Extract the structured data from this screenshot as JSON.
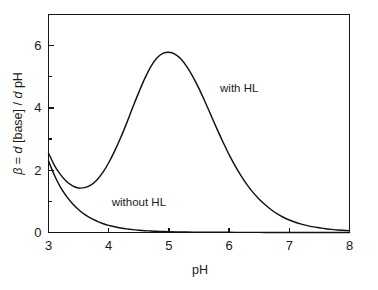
{
  "chart_data": {
    "type": "line",
    "title": "",
    "xlabel": "pH",
    "ylabel_parts": {
      "beta": "β",
      "equals": " = ",
      "d1": "d",
      "base": " [base] / ",
      "d2": "d",
      "ph": " pH"
    },
    "ylabel": "β = d [base] / d pH",
    "xlim": [
      3,
      8
    ],
    "ylim": [
      0,
      7
    ],
    "grid": false,
    "legend_position": "inline-annotations",
    "x_ticks_major": [
      3,
      4,
      5,
      6,
      7,
      8
    ],
    "x_tick_labels": [
      "3",
      "4",
      "5",
      "6",
      "7",
      "8"
    ],
    "y_ticks_major": [
      0,
      2,
      4,
      6
    ],
    "y_tick_labels": [
      "0",
      "2",
      "4",
      "6"
    ],
    "y_ticks_minor": [
      1,
      3,
      5,
      7
    ],
    "annotations": [
      {
        "text": "with HL",
        "x": 5.85,
        "y": 4.5
      },
      {
        "text": "without HL",
        "x": 4.05,
        "y": 0.85
      }
    ],
    "series": [
      {
        "name": "with HL",
        "color": "#111111",
        "x": [
          3.0,
          3.1,
          3.2,
          3.3,
          3.4,
          3.5,
          3.6,
          3.7,
          3.8,
          3.9,
          4.0,
          4.1,
          4.2,
          4.3,
          4.4,
          4.5,
          4.6,
          4.7,
          4.8,
          4.9,
          5.0,
          5.1,
          5.2,
          5.3,
          5.4,
          5.5,
          5.6,
          5.7,
          5.8,
          5.9,
          6.0,
          6.1,
          6.2,
          6.3,
          6.4,
          6.5,
          6.6,
          6.7,
          6.8,
          6.9,
          7.0,
          7.1,
          7.2,
          7.3,
          7.4,
          7.5,
          7.6,
          7.7,
          7.8,
          7.9,
          8.0
        ],
        "y": [
          2.55,
          2.15,
          1.86,
          1.64,
          1.5,
          1.43,
          1.44,
          1.52,
          1.68,
          1.92,
          2.24,
          2.62,
          3.05,
          3.52,
          4.02,
          4.5,
          4.95,
          5.33,
          5.6,
          5.75,
          5.79,
          5.73,
          5.57,
          5.32,
          5.0,
          4.62,
          4.2,
          3.76,
          3.32,
          2.9,
          2.5,
          2.14,
          1.82,
          1.53,
          1.28,
          1.07,
          0.89,
          0.73,
          0.6,
          0.49,
          0.4,
          0.33,
          0.27,
          0.22,
          0.18,
          0.15,
          0.12,
          0.1,
          0.08,
          0.07,
          0.06
        ]
      },
      {
        "name": "without HL",
        "color": "#111111",
        "x": [
          3.0,
          3.1,
          3.2,
          3.3,
          3.4,
          3.5,
          3.6,
          3.7,
          3.8,
          3.9,
          4.0,
          4.1,
          4.2,
          4.3,
          4.4,
          4.5,
          4.6,
          4.7,
          4.8,
          4.9,
          5.0,
          5.2,
          5.4,
          5.6,
          5.8,
          6.0,
          6.2,
          6.4,
          6.6,
          6.8,
          7.0,
          7.2,
          7.4,
          7.6,
          7.8,
          8.0
        ],
        "y": [
          2.3,
          1.83,
          1.45,
          1.16,
          0.92,
          0.73,
          0.58,
          0.46,
          0.37,
          0.29,
          0.23,
          0.185,
          0.147,
          0.117,
          0.093,
          0.074,
          0.059,
          0.047,
          0.038,
          0.03,
          0.024,
          0.016,
          0.011,
          0.008,
          0.006,
          0.005,
          0.004,
          0.004,
          0.003,
          0.003,
          0.003,
          0.003,
          0.003,
          0.003,
          0.003,
          0.003
        ]
      }
    ]
  }
}
